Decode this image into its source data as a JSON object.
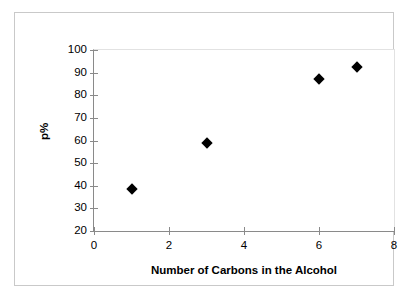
{
  "chart_data": {
    "type": "scatter",
    "title": "",
    "xlabel": "Number of Carbons in the Alcohol",
    "ylabel": "p%",
    "xlim": [
      0,
      8
    ],
    "ylim": [
      20,
      100
    ],
    "xticks": [
      0,
      2,
      4,
      6,
      8
    ],
    "yticks": [
      20,
      30,
      40,
      50,
      60,
      70,
      80,
      90,
      100
    ],
    "xtick_labels": [
      "0",
      "2",
      "4",
      "6",
      "8"
    ],
    "ytick_labels": [
      "20",
      "30",
      "40",
      "50",
      "60",
      "70",
      "80",
      "90",
      "100"
    ],
    "grid": false,
    "legend": null,
    "marker": "diamond",
    "marker_color": "#000000",
    "series": [
      {
        "name": "p%",
        "points": [
          {
            "x": 1,
            "y": 38.5
          },
          {
            "x": 3,
            "y": 59
          },
          {
            "x": 6,
            "y": 87
          },
          {
            "x": 7,
            "y": 92.5
          }
        ]
      }
    ],
    "x": [
      1,
      3,
      6,
      7
    ],
    "values": [
      38.5,
      59,
      87,
      92.5
    ]
  }
}
